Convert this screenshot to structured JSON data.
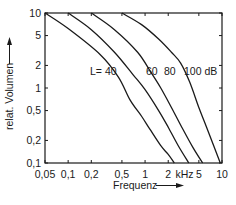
{
  "chart_data": {
    "type": "line",
    "title": "",
    "xlabel": "Frequenz",
    "ylabel": "relat. Volumen",
    "x_scale": "log",
    "y_scale": "log",
    "xlim": [
      0.05,
      10
    ],
    "ylim": [
      0.1,
      10
    ],
    "x_unit_label": "kHz",
    "x_ticks": [
      0.05,
      0.1,
      0.2,
      0.5,
      1,
      2,
      5,
      10
    ],
    "x_tick_labels": [
      "0,05",
      "0,1",
      "0,2",
      "0,5",
      "1",
      "2",
      "5",
      "10"
    ],
    "y_ticks": [
      0.1,
      0.2,
      0.5,
      1,
      2,
      5,
      10
    ],
    "y_tick_labels": [
      "0,1",
      "0,2",
      "0,5",
      "1",
      "2",
      "5",
      "10"
    ],
    "grid": false,
    "legend": "inline curve labels",
    "series": [
      {
        "name": "L= 40",
        "level_db": 40,
        "x": [
          0.05,
          0.1,
          0.26,
          0.45,
          0.64,
          0.9,
          1.16,
          1.6,
          2.0,
          2.4
        ],
        "y": [
          10,
          6.2,
          2.8,
          1.4,
          0.69,
          0.42,
          0.28,
          0.17,
          0.13,
          0.1
        ]
      },
      {
        "name": "60",
        "level_db": 60,
        "x": [
          0.1,
          0.2,
          0.4,
          0.7,
          1.0,
          1.5,
          2.0,
          2.7,
          3.7
        ],
        "y": [
          10,
          6.0,
          3.0,
          1.5,
          0.95,
          0.5,
          0.3,
          0.17,
          0.1
        ]
      },
      {
        "name": "80",
        "level_db": 80,
        "x": [
          0.2,
          0.4,
          0.8,
          1.2,
          1.6,
          2.2,
          3.0,
          4.2,
          5.6
        ],
        "y": [
          10,
          6.0,
          3.0,
          1.6,
          1.0,
          0.55,
          0.3,
          0.16,
          0.1
        ]
      },
      {
        "name": "100 dB",
        "level_db": 100,
        "x": [
          0.5,
          0.9,
          1.5,
          2.2,
          2.9,
          3.8,
          5.0,
          6.3,
          7.8,
          9.5
        ],
        "y": [
          10,
          7.0,
          4.5,
          3.0,
          2.15,
          1.2,
          0.55,
          0.3,
          0.17,
          0.1
        ]
      }
    ],
    "curve_labels": [
      {
        "text": "L= 40",
        "x_px": 90,
        "y_px": 75
      },
      {
        "text": "60",
        "x_px": 146,
        "y_px": 75
      },
      {
        "text": "80",
        "x_px": 164,
        "y_px": 75
      },
      {
        "text": "100 dB",
        "x_px": 184,
        "y_px": 75
      }
    ]
  },
  "labels": {
    "xlabel": "Frequenz",
    "ylabel": "relat. Volumen",
    "x_unit": "kHz",
    "curve_40": "L= 40",
    "curve_60": "60",
    "curve_80": "80",
    "curve_100": "100 dB"
  },
  "colors": {
    "ink": "#1a1a1a",
    "background": "#ffffff"
  }
}
